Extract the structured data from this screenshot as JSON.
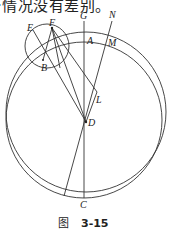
{
  "text": {
    "top_line": "·情况没有差别。"
  },
  "figure": {
    "labels": {
      "E": "E",
      "F": "F",
      "G": "G",
      "N": "N",
      "A": "A",
      "M": "M",
      "B": "B",
      "L": "L",
      "D": "D",
      "C": "C"
    },
    "caption": {
      "prefix": "图",
      "number": "3-15"
    }
  }
}
